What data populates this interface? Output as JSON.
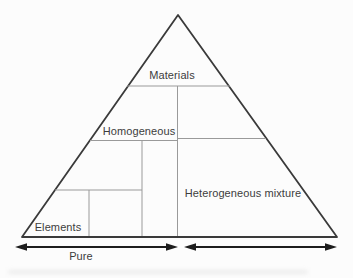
{
  "diagram": {
    "regions": {
      "materials": "Materials",
      "homogeneous": "Homogeneous",
      "heterogeneous_mixture": "Heterogeneous mixture",
      "elements": "Elements"
    },
    "spans": {
      "pure": "Pure"
    },
    "icons": {
      "pure_span": "double-headed-arrow",
      "mixture_span": "double-headed-arrow"
    },
    "colors": {
      "background": "#fcfcfc",
      "outline": "#3a3a3a",
      "divider": "#9a9a9a",
      "arrow": "#1d1d1d",
      "text": "#3c3c3c"
    }
  }
}
